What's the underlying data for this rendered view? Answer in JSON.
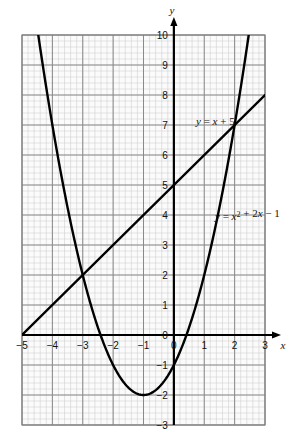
{
  "figure": {
    "kind": "cartesian-graph",
    "background_color": "#ffffff",
    "ink_color": "#000000",
    "major_grid_color": "#8a8a8a",
    "minor_grid_color": "#c9c9c9",
    "plot_fill_color": "#fbfbfb"
  },
  "axes": {
    "x_axis_name": "x",
    "y_axis_name": "y",
    "x_min": -5,
    "x_max": 3,
    "y_min": -3,
    "y_max": 10,
    "x_tick_labels": [
      "−5",
      "−4",
      "−3",
      "−2",
      "−1",
      "0",
      "1",
      "2",
      "3"
    ],
    "x_tick_values": [
      -5,
      -4,
      -3,
      -2,
      -1,
      0,
      1,
      2,
      3
    ],
    "y_tick_labels": [
      "10",
      "9",
      "8",
      "7",
      "6",
      "5",
      "4",
      "3",
      "2",
      "1",
      "0",
      "−1",
      "−2",
      "−3"
    ],
    "y_tick_values": [
      10,
      9,
      8,
      7,
      6,
      5,
      4,
      3,
      2,
      1,
      0,
      -1,
      -2,
      -3
    ],
    "major_step": 1,
    "minor_subdivisions": 5,
    "grid": true,
    "x_axis_arrow": true,
    "y_axis_arrow": true
  },
  "labels": {
    "line_label": "y = x + 5",
    "parabola_label": "y = x² + 2x − 1",
    "line_label_prefix": "y",
    "line_label_rest": " = ",
    "parabola_label_prefix": "y"
  },
  "chart_data": {
    "type": "line",
    "title": "",
    "xlabel": "x",
    "ylabel": "y",
    "xlim": [
      -5,
      3
    ],
    "ylim": [
      -3,
      10
    ],
    "grid": true,
    "legend_position": "inline-right",
    "series": [
      {
        "name": "y = x + 5",
        "kind": "straight-line",
        "equation": "y = x + 5",
        "slope": 1,
        "intercept": 5,
        "x_start": -5,
        "x_end": 3,
        "x": [
          -5,
          -4,
          -3,
          -2,
          -1,
          0,
          1,
          2,
          3
        ],
        "values": [
          0,
          1,
          2,
          3,
          4,
          5,
          6,
          7,
          8
        ],
        "label_x": 3.1,
        "label_y": 7.3
      },
      {
        "name": "y = x² + 2x − 1",
        "kind": "parabola",
        "equation": "y = x^2 + 2x - 1",
        "coefficients": {
          "a": 1,
          "b": 2,
          "c": -1
        },
        "vertex": [
          -1,
          -2
        ],
        "x_start": -4.55,
        "x_end": 2.6,
        "x": [
          -4.5,
          -4,
          -3.5,
          -3,
          -2.5,
          -2,
          -1.5,
          -1,
          -0.5,
          0,
          0.5,
          1,
          1.5,
          2,
          2.5
        ],
        "values": [
          10.25,
          7,
          4.25,
          2,
          0.25,
          -1,
          -1.75,
          -2,
          -1.75,
          -1,
          0.25,
          2,
          4.25,
          7,
          10.25
        ],
        "label_x": 2.5,
        "label_y": 4.1
      }
    ],
    "intersections": [
      {
        "x": -3,
        "y": 2
      },
      {
        "x": 2,
        "y": 7
      }
    ],
    "roots_of_parabola": [
      -2.414,
      0.414
    ]
  }
}
